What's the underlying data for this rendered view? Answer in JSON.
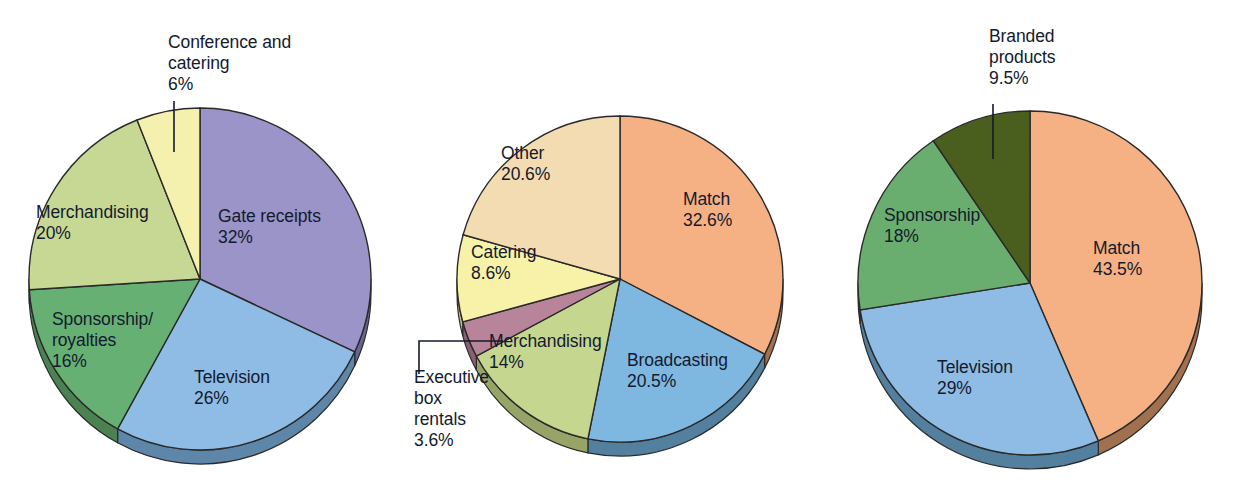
{
  "figure": {
    "background": "#ffffff",
    "text_color": "#141a2e",
    "outline_color": "#2a2a2a"
  },
  "chart_data": [
    {
      "type": "pie",
      "id": "pie-left",
      "title": "",
      "legend_position": "none",
      "start_angle_deg": 0,
      "direction": "clockwise",
      "center": {
        "x": 200,
        "y": 279
      },
      "radius": 171,
      "depth": 14,
      "categories": [
        "Gate receipts",
        "Television",
        "Sponsorship/ royalties",
        "Merchandising",
        "Conference and catering"
      ],
      "values": [
        32,
        26,
        16,
        20,
        6
      ],
      "labels": [
        "32%",
        "26%",
        "16%",
        "20%",
        "6%"
      ],
      "colors": [
        "#9a94c8",
        "#8ebce4",
        "#67b073",
        "#c7d894",
        "#f4f0ad"
      ],
      "side_colors": [
        "#6a6494",
        "#5d86a8",
        "#4a8252",
        "#97a66a",
        "#c4bf7e"
      ],
      "slices": [
        {
          "name": "Gate receipts",
          "value": 32,
          "label_line1": "Gate receipts",
          "label_line2": "32%",
          "color": "#9a94c8",
          "label_x": 218,
          "label_y": 222,
          "callout": false
        },
        {
          "name": "Television",
          "value": 26,
          "label_line1": "Television",
          "label_line2": "26%",
          "color": "#8ebce4",
          "label_x": 194,
          "label_y": 383,
          "callout": false
        },
        {
          "name": "Sponsorship/ royalties",
          "value": 16,
          "label_line1": "Sponsorship/",
          "label_line2": "royalties",
          "label_line3": "16%",
          "color": "#67b073",
          "label_x": 52,
          "label_y": 325,
          "callout": false
        },
        {
          "name": "Merchandising",
          "value": 20,
          "label_line1": "Merchandising",
          "label_line2": "20%",
          "color": "#c7d894",
          "label_x": 36,
          "label_y": 218,
          "callout": false
        },
        {
          "name": "Conference and catering",
          "value": 6,
          "label_line1": "Conference and",
          "label_line2": "catering",
          "label_line3": "6%",
          "color": "#f4f0ad",
          "label_x": 168,
          "label_y": 48,
          "callout": true,
          "leader": "M174,101 L174,152"
        }
      ]
    },
    {
      "type": "pie",
      "id": "pie-middle",
      "title": "",
      "legend_position": "none",
      "start_angle_deg": 0,
      "direction": "clockwise",
      "center": {
        "x": 620,
        "y": 279
      },
      "radius": 163,
      "depth": 14,
      "categories": [
        "Match",
        "Broadcasting",
        "Merchandising",
        "Executive box rentals",
        "Catering",
        "Other"
      ],
      "values": [
        32.6,
        20.5,
        14,
        3.6,
        8.6,
        20.6
      ],
      "labels": [
        "32.6%",
        "20.5%",
        "14%",
        "3.6%",
        "8.6%",
        "20.6%"
      ],
      "colors": [
        "#f5b183",
        "#7eb7e0",
        "#c5d68e",
        "#b8849a",
        "#f7f2a8",
        "#f4dcb2"
      ],
      "side_colors": [
        "#a1714f",
        "#53809f",
        "#96a468",
        "#8a6073",
        "#c4bf7e",
        "#bfab86"
      ],
      "slices": [
        {
          "name": "Match",
          "value": 32.6,
          "label_line1": "Match",
          "label_line2": "32.6%",
          "color": "#f5b183",
          "label_x": 683,
          "label_y": 205,
          "callout": false
        },
        {
          "name": "Broadcasting",
          "value": 20.5,
          "label_line1": "Broadcasting",
          "label_line2": "20.5%",
          "color": "#7eb7e0",
          "label_x": 627,
          "label_y": 366,
          "callout": false
        },
        {
          "name": "Merchandising",
          "value": 14,
          "label_line1": "Merchandising",
          "label_line2": "14%",
          "color": "#c5d68e",
          "label_x": 489,
          "label_y": 347,
          "callout": false
        },
        {
          "name": "Executive box rentals",
          "value": 3.6,
          "label_line1": "Executive",
          "label_line2": "box",
          "label_line3": "rentals",
          "label_line4": "3.6%",
          "color": "#b8849a",
          "label_x": 414,
          "label_y": 383,
          "callout": true,
          "leader": "M503,341 L419,341 L419,374"
        },
        {
          "name": "Catering",
          "value": 8.6,
          "label_line1": "Catering",
          "label_line2": "8.6%",
          "color": "#f7f2a8",
          "label_x": 471,
          "label_y": 258,
          "callout": false
        },
        {
          "name": "Other",
          "value": 20.6,
          "label_line1": "Other",
          "label_line2": "20.6%",
          "color": "#f4dcb2",
          "label_x": 501,
          "label_y": 159,
          "callout": false
        }
      ]
    },
    {
      "type": "pie",
      "id": "pie-right",
      "title": "",
      "legend_position": "none",
      "start_angle_deg": 0,
      "direction": "clockwise",
      "center": {
        "x": 1030,
        "y": 283
      },
      "radius": 172,
      "depth": 14,
      "categories": [
        "Match",
        "Television",
        "Sponsorship",
        "Branded products"
      ],
      "values": [
        43.5,
        29,
        18,
        9.5
      ],
      "labels": [
        "43.5%",
        "29%",
        "18%",
        "9.5%"
      ],
      "colors": [
        "#f5b183",
        "#8ebce4",
        "#6aae6f",
        "#4a5f1e"
      ],
      "side_colors": [
        "#a1714f",
        "#53809f",
        "#4a8252",
        "#32400f"
      ],
      "slices": [
        {
          "name": "Match",
          "value": 43.5,
          "label_line1": "Match",
          "label_line2": "43.5%",
          "color": "#f5b183",
          "label_x": 1093,
          "label_y": 254,
          "callout": false
        },
        {
          "name": "Television",
          "value": 29,
          "label_line1": "Television",
          "label_line2": "29%",
          "color": "#8ebce4",
          "label_x": 937,
          "label_y": 373,
          "callout": false
        },
        {
          "name": "Sponsorship",
          "value": 18,
          "label_line1": "Sponsorship",
          "label_line2": "18%",
          "color": "#6aae6f",
          "label_x": 884,
          "label_y": 221,
          "callout": false
        },
        {
          "name": "Branded products",
          "value": 9.5,
          "label_line1": "Branded",
          "label_line2": "products",
          "label_line3": "9.5%",
          "color": "#4a5f1e",
          "label_x": 989,
          "label_y": 42,
          "callout": true,
          "leader": "M993,104 L993,159"
        }
      ]
    }
  ]
}
